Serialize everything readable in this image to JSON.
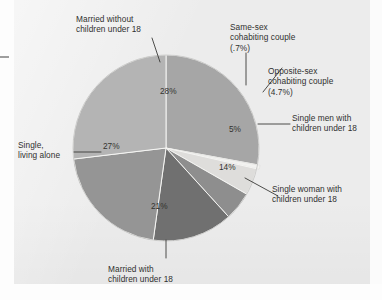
{
  "figure": {
    "panel_background": "#ececec",
    "page_background": "#fdfdfd"
  },
  "chart_data": {
    "type": "pie",
    "title": "",
    "subtitle": "",
    "xlabel": "",
    "ylabel": "",
    "grid": false,
    "legend_position": "callout-labels",
    "total_percent": 100,
    "categories": [
      "Married without children under 18",
      "Same-sex cohabiting couple",
      "Opposite-sex cohabiting couple",
      "Single men with children under 18",
      "Single woman with children under 18",
      "Married with children under 18",
      "Single, living alone"
    ],
    "values": [
      28,
      0.7,
      4.7,
      5,
      14,
      21,
      27
    ],
    "value_labels": [
      "28%",
      "(.7%)",
      "(4.7%)",
      "5%",
      "14%",
      "21%",
      "27%"
    ],
    "slice_colors": [
      "#a6a6a6",
      "#f2f2f0",
      "#dedddb",
      "#8e8e8e",
      "#6f6f6f",
      "#959595",
      "#b4b4b4"
    ],
    "slices": [
      {
        "label": "Married without children under 18",
        "value": 28,
        "inline_label": "28%",
        "color": "#a6a6a6",
        "label_lines": [
          "Married without",
          "children under 18"
        ]
      },
      {
        "label": "Same-sex cohabiting couple",
        "value": 0.7,
        "inline_label": "",
        "color": "#f2f2f0",
        "label_lines": [
          "Same-sex",
          "cohabiting couple",
          "(.7%)"
        ]
      },
      {
        "label": "Opposite-sex cohabiting couple",
        "value": 4.7,
        "inline_label": "",
        "color": "#dedddb",
        "label_lines": [
          "Opposite-sex",
          "cohabiting couple",
          "(4.7%)"
        ]
      },
      {
        "label": "Single men with children under 18",
        "value": 5,
        "inline_label": "5%",
        "color": "#8e8e8e",
        "label_lines": [
          "Single men with",
          "children under 18"
        ]
      },
      {
        "label": "Single woman with children under 18",
        "value": 14,
        "inline_label": "14%",
        "color": "#6f6f6f",
        "label_lines": [
          "Single woman with",
          "children under 18"
        ]
      },
      {
        "label": "Married with children under 18",
        "value": 21,
        "inline_label": "21%",
        "color": "#959595",
        "label_lines": [
          "Married with",
          "children under 18"
        ]
      },
      {
        "label": "Single, living alone",
        "value": 27,
        "inline_label": "27%",
        "color": "#b4b4b4",
        "label_lines": [
          "Single,",
          "living alone"
        ]
      }
    ]
  },
  "callouts": {
    "married_without_l1": "Married without",
    "married_without_l2": "children under 18",
    "samesex_l1": "Same-sex",
    "samesex_l2": "cohabiting couple",
    "samesex_l3": "(.7%)",
    "oppositesex_l1": "Opposite-sex",
    "oppositesex_l2": "cohabiting couple",
    "oppositesex_l3": "(4.7%)",
    "single_men_l1": "Single men with",
    "single_men_l2": "children under 18",
    "single_woman_l1": "Single woman with",
    "single_woman_l2": "children under 18",
    "married_with_l1": "Married with",
    "married_with_l2": "children under 18",
    "single_alone_l1": "Single,",
    "single_alone_l2": "living alone"
  },
  "inline_percents": {
    "married_without": "28%",
    "single_alone": "27%",
    "married_with": "21%",
    "single_woman": "14%",
    "single_men": "5%"
  }
}
